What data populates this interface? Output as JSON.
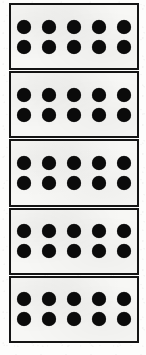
{
  "sheet": {
    "description": "Scanned worksheet showing a vertical stack of five ten-frame dot cards",
    "background_color": "#fdfdfc",
    "width": 146,
    "height": 355
  },
  "style": {
    "border_color": "#141414",
    "dot_color": "#0b0b0b",
    "card_fill_color": "#f7f7f5",
    "border_width_px": 2.5,
    "dot_diameter_px": 14
  },
  "frames": [
    {
      "id": "ten-frame-1",
      "label": "Ten frame 1",
      "dot_count": 10,
      "rows": 2,
      "columns": 5,
      "row_counts": [
        5,
        5
      ]
    },
    {
      "id": "ten-frame-2",
      "label": "Ten frame 2",
      "dot_count": 10,
      "rows": 2,
      "columns": 5,
      "row_counts": [
        5,
        5
      ]
    },
    {
      "id": "ten-frame-3",
      "label": "Ten frame 3",
      "dot_count": 10,
      "rows": 2,
      "columns": 5,
      "row_counts": [
        5,
        5
      ]
    },
    {
      "id": "ten-frame-4",
      "label": "Ten frame 4",
      "dot_count": 10,
      "rows": 2,
      "columns": 5,
      "row_counts": [
        5,
        5
      ]
    },
    {
      "id": "ten-frame-5",
      "label": "Ten frame 5",
      "dot_count": 10,
      "rows": 2,
      "columns": 5,
      "row_counts": [
        5,
        5
      ]
    }
  ],
  "totals": {
    "frame_count": 5,
    "dots_per_frame": 10,
    "total_dots": 50
  }
}
